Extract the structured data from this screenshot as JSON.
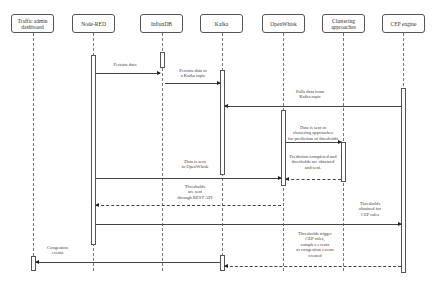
{
  "actors": [
    {
      "id": "traffic",
      "label": "Traffic admin dashboard",
      "x": 33
    },
    {
      "id": "nodered",
      "label": "Node-RED",
      "x": 93
    },
    {
      "id": "influx",
      "label": "InfluxDB",
      "x": 162
    },
    {
      "id": "kafka",
      "label": "Kafka",
      "x": 222
    },
    {
      "id": "openwhisk",
      "label": "OpenWhisk",
      "x": 283
    },
    {
      "id": "clustering",
      "label": "Clustering approaches",
      "x": 343
    },
    {
      "id": "cep",
      "label": "CEP engine",
      "x": 403
    }
  ],
  "messages": [
    {
      "from": "Node-RED",
      "to": "InfluxDB",
      "label": "Persists data",
      "style": "solid"
    },
    {
      "from": "InfluxDB",
      "to": "Kafka",
      "label": "Persists data to a Kafka topic",
      "style": "solid"
    },
    {
      "from": "CEP engine",
      "to": "Kafka",
      "label": "Pulls data from Kafka topic",
      "style": "solid"
    },
    {
      "from": "OpenWhisk",
      "to": "Clustering approaches",
      "label": "Data is sent to clustering approaches for prediction of thresholds",
      "style": "solid"
    },
    {
      "from": "Clustering approaches",
      "to": "OpenWhisk",
      "label": "Prediction completed and thresholds are obtained and sent.",
      "style": "dashed"
    },
    {
      "from": "Node-RED",
      "to": "OpenWhisk",
      "label": "Data is sent to OpenWhisk",
      "style": "solid"
    },
    {
      "from": "OpenWhisk",
      "to": "Node-RED",
      "label": "Thresholds are sent through REST API",
      "style": "dashed"
    },
    {
      "from": "Node-RED",
      "to": "CEP engine",
      "label": "Thresholds obtained for CEP rules",
      "style": "solid"
    },
    {
      "from": "CEP engine",
      "to": "Kafka",
      "label": "Thresholds trigger CEP rules, complex events or congestion events created",
      "style": "dashed"
    },
    {
      "from": "Kafka",
      "to": "Traffic admin dashboard",
      "label": "Congestion events",
      "style": "solid"
    }
  ],
  "labels": {
    "m1": "Persists data",
    "m2": "Persists data to\na Kafka topic",
    "m3": "Pulls data from\nKafka topic",
    "m4": "Data is sent to\nclustering approaches\nfor prediction of thresholds",
    "m5": "Prediction completed and\nthresholds are obtained\nand sent.",
    "m6": "Data is sent\nto OpenWhisk",
    "m7": "Thresholds\nare sent\nthrough REST API",
    "m8": "Thresholds\nobtained for\nCEP rules",
    "m9": "Thresholds trigger\nCEP rules,\ncomplex events\nor congestion events\ncreated",
    "m10": "Congestion\nevents"
  }
}
